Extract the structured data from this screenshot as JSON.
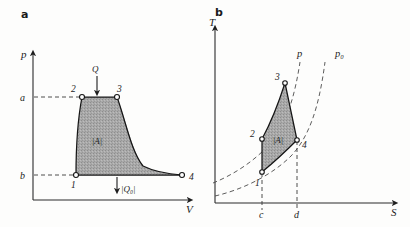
{
  "figure": {
    "caption_letters": [
      "a",
      "b"
    ]
  },
  "panel_a": {
    "letter": "a",
    "y_axis_label": "p",
    "x_axis_label": "V",
    "y_ticks": [
      {
        "label": "a",
        "value_pos": "upper"
      },
      {
        "label": "b",
        "value_pos": "lower"
      }
    ],
    "points": [
      {
        "id": "1",
        "label": "1"
      },
      {
        "id": "2",
        "label": "2"
      },
      {
        "id": "3",
        "label": "3"
      },
      {
        "id": "4",
        "label": "4"
      }
    ],
    "area_label": "|A|",
    "heat_in_label": "Q",
    "heat_out_label": "|Q₀|"
  },
  "panel_b": {
    "letter": "b",
    "y_axis_label": "T",
    "x_axis_label": "S",
    "x_ticks": [
      {
        "label": "c"
      },
      {
        "label": "d"
      }
    ],
    "points": [
      {
        "id": "1",
        "label": "1"
      },
      {
        "id": "2",
        "label": "2"
      },
      {
        "id": "3",
        "label": "3"
      },
      {
        "id": "4",
        "label": "4"
      }
    ],
    "area_label": "|A|",
    "isobar_labels": [
      "p",
      "p₀"
    ]
  },
  "colors": {
    "background": "#fdfdfc",
    "ink": "#1c1c1c",
    "shading": "#a8a8a8",
    "dashed": "#4a4a4a"
  }
}
